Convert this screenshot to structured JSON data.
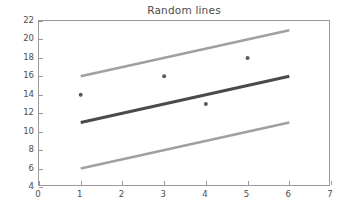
{
  "chart_data": {
    "type": "line",
    "title": "Random lines",
    "xlabel": "",
    "ylabel": "",
    "xlim": [
      0,
      7
    ],
    "ylim": [
      4,
      22
    ],
    "xticks": [
      0,
      1,
      2,
      3,
      4,
      5,
      6,
      7
    ],
    "yticks": [
      4,
      6,
      8,
      10,
      12,
      14,
      16,
      18,
      20,
      22
    ],
    "grid": false,
    "legend": "none",
    "background_color": "#ffffff",
    "frame_color": "#9a9a9a",
    "text_color": "#4d4d4d",
    "series": [
      {
        "name": "upper line",
        "type": "line",
        "color": "#a0a0a0",
        "linewidth": 2.6,
        "x": [
          1,
          6
        ],
        "y": [
          16,
          21
        ]
      },
      {
        "name": "middle line",
        "type": "line",
        "color": "#4a4a4a",
        "linewidth": 3.0,
        "x": [
          1,
          6
        ],
        "y": [
          11,
          16
        ]
      },
      {
        "name": "lower line",
        "type": "line",
        "color": "#a0a0a0",
        "linewidth": 2.6,
        "x": [
          1,
          6
        ],
        "y": [
          6,
          11
        ]
      },
      {
        "name": "scatter points",
        "type": "scatter",
        "color": "#595959",
        "marker": "o",
        "markersize": 4,
        "x": [
          1,
          3,
          4,
          5
        ],
        "y": [
          14,
          16,
          13,
          18
        ]
      }
    ]
  }
}
